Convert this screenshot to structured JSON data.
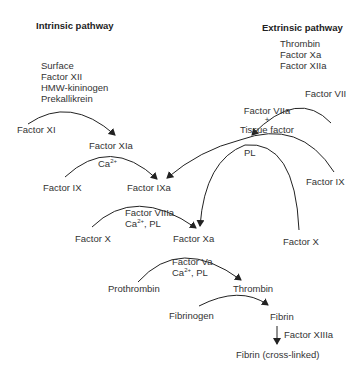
{
  "diagram": {
    "title_intrinsic": "Intrinsic pathway",
    "title_extrinsic": "Extrinsic pathway",
    "intrinsic_activators": [
      "Surface",
      "Factor XII",
      "HMW-kininogen",
      "Prekallikrein"
    ],
    "extrinsic_activators": [
      "Thrombin",
      "Factor Xa",
      "Factor XIIa"
    ],
    "nodes": {
      "factor_xi": "Factor XI",
      "factor_xia": "Factor XIa",
      "factor_ix_left": "Factor IX",
      "factor_ixa": "Factor IXa",
      "factor_vii": "Factor VII",
      "factor_viia": "Factor VIIa",
      "plus": "+",
      "tissue_factor": "Tissue factor",
      "factor_ix_right": "Factor IX",
      "factor_x_left": "Factor X",
      "factor_x_right": "Factor X",
      "factor_xa": "Factor Xa",
      "prothrombin": "Prothrombin",
      "thrombin": "Thrombin",
      "fibrinogen": "Fibrinogen",
      "fibrin": "Fibrin",
      "fibrin_crosslinked": "Fibrin (cross-linked)"
    },
    "cofactors": {
      "ca_ixa": "Ca",
      "ca_sup": "2+",
      "pl_extrinsic": "PL",
      "viiia_line1": "Factor VIIIa",
      "viiia_line2_ca": "Ca",
      "viiia_line2_rest": ", PL",
      "va_line1": "Factor Va",
      "va_line2_ca": "Ca",
      "va_line2_rest": ", PL",
      "xiiia": "Factor XIIIa"
    }
  }
}
